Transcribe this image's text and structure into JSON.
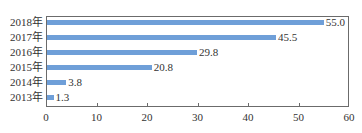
{
  "chart_data": {
    "type": "bar",
    "orientation": "horizontal",
    "title": "",
    "xlabel": "",
    "ylabel": "",
    "categories": [
      "2018年",
      "2017年",
      "2016年",
      "2015年",
      "2014年",
      "2013年"
    ],
    "values": [
      55.0,
      45.5,
      29.8,
      20.8,
      3.8,
      1.3
    ],
    "value_labels": [
      "55.0",
      "45.5",
      "29.8",
      "20.8",
      "3.8",
      "1.3"
    ],
    "xlim": [
      0,
      60
    ],
    "xticks": [
      0,
      10,
      20,
      30,
      40,
      50,
      60
    ],
    "xtick_labels": [
      "0",
      "10",
      "20",
      "30",
      "40",
      "50",
      "60"
    ],
    "grid": false,
    "legend": null,
    "bar_color": "#6f9fd8"
  }
}
